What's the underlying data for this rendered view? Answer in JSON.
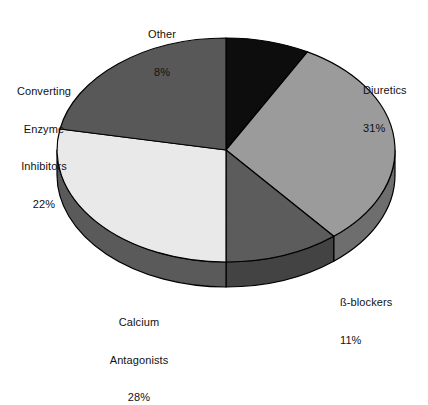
{
  "chart_data": {
    "type": "pie",
    "title": "",
    "subtitle": "",
    "xlabel": "",
    "ylabel": "",
    "grid": false,
    "legend_position": "none",
    "style": "3d-exploded-none",
    "start_angle_deg": 0,
    "direction": "clockwise",
    "categories": [
      "Other",
      "Diuretics",
      "ß-blockers",
      "Calcium Antagonists",
      "Converting Enzyme Inhibitors"
    ],
    "values": [
      8,
      31,
      11,
      28,
      22
    ],
    "units": "%",
    "slices": [
      {
        "label": "Other",
        "value": 8,
        "value_text": "8%",
        "color": "#0d0d0d",
        "side_color": "#050505",
        "label_lines": [
          "Other",
          "8%"
        ]
      },
      {
        "label": "Diuretics",
        "value": 31,
        "value_text": "31%",
        "color": "#9b9b9b",
        "side_color": "#6e6e6e",
        "label_lines": [
          "Diuretics",
          "31%"
        ]
      },
      {
        "label": "ß-blockers",
        "value": 11,
        "value_text": "11%",
        "color": "#5c5c5c",
        "side_color": "#434343",
        "label_lines": [
          "ß-blockers",
          "11%"
        ]
      },
      {
        "label": "Calcium Antagonists",
        "value": 28,
        "value_text": "28%",
        "color": "#e9e9e9",
        "side_color": "#5a5a5a",
        "label_lines": [
          "Calcium",
          "Antagonists",
          "28%"
        ]
      },
      {
        "label": "Converting Enzyme Inhibitors",
        "value": 22,
        "value_text": "22%",
        "color": "#585858",
        "side_color": "#3f3f3f",
        "label_lines": [
          "Converting",
          "Enzyme",
          "Inhibitors",
          "22%"
        ]
      }
    ]
  },
  "labels": {
    "diuretics": {
      "name": "Diuretics",
      "pct": "31%"
    },
    "bblockers": {
      "name": "ß-blockers",
      "pct": "11%"
    },
    "calcium": {
      "line1": "Calcium",
      "line2": "Antagonists",
      "pct": "28%"
    },
    "cei": {
      "line1": "Converting",
      "line2": "Enzyme",
      "line3": "Inhibitors",
      "pct": "22%"
    },
    "other": {
      "name": "Other",
      "pct": "8%"
    }
  },
  "colors": {
    "background": "#ffffff",
    "outline": "#000000",
    "text": "#111111"
  }
}
